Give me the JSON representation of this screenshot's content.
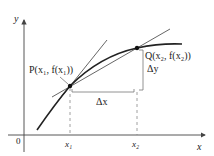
{
  "diagram": {
    "axes": {
      "x_label": "x",
      "y_label": "y",
      "origin_label": "0"
    },
    "points": {
      "P": {
        "label": "P(x₁, f(x₁))"
      },
      "Q": {
        "label": "Q(x₂, f(x₂))"
      }
    },
    "ticks": {
      "x1": "x₁",
      "x2": "x₂"
    },
    "increments": {
      "dx": "Δx",
      "dy": "Δy"
    },
    "colors": {
      "curve": "#222222",
      "lines": "#555555",
      "dashed": "#777777",
      "bracket": "#666666"
    }
  }
}
